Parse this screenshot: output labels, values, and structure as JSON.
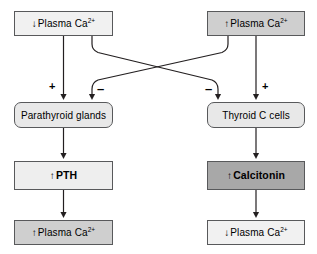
{
  "diagram": {
    "type": "flowchart",
    "colors": {
      "stroke": "#58595b",
      "line": "#231f20",
      "fill_light": "#f1f1f1",
      "fill_pale": "#e8e8e8",
      "fill_mid": "#cfcfcf",
      "fill_dark": "#a8a8a8",
      "text": "#000000",
      "background": "#ffffff"
    },
    "nodes": [
      {
        "id": "low-plasma-ca",
        "arrow": "↓",
        "text": "Plasma Ca",
        "sup": "2+",
        "shape": "rect",
        "fill": "#f1f1f1"
      },
      {
        "id": "high-plasma-ca",
        "arrow": "↑",
        "text": "Plasma Ca",
        "sup": "2+",
        "shape": "rect",
        "fill": "#cfcfcf"
      },
      {
        "id": "parathyroid-glands",
        "arrow": "",
        "text": "Parathyroid glands",
        "sup": "",
        "shape": "rounded",
        "fill": "#e8e8e8"
      },
      {
        "id": "thyroid-c-cells",
        "arrow": "",
        "text": "Thyroid C cells",
        "sup": "",
        "shape": "rounded",
        "fill": "#e8e8e8"
      },
      {
        "id": "pth",
        "arrow": "↑",
        "text": "PTH",
        "sup": "",
        "shape": "rect",
        "fill": "#eeeeee"
      },
      {
        "id": "calcitonin",
        "arrow": "↑",
        "text": "Calcitonin",
        "sup": "",
        "shape": "rect",
        "fill": "#a8a8a8"
      },
      {
        "id": "result-high-plasma-ca",
        "arrow": "↑",
        "text": "Plasma Ca",
        "sup": "2+",
        "shape": "rect",
        "fill": "#cfcfcf"
      },
      {
        "id": "result-low-plasma-ca",
        "arrow": "↓",
        "text": "Plasma Ca",
        "sup": "2+",
        "shape": "rect",
        "fill": "#f1f1f1"
      }
    ],
    "signs": [
      {
        "id": "plus-left",
        "symbol": "+"
      },
      {
        "id": "minus-left",
        "symbol": "–"
      },
      {
        "id": "minus-right",
        "symbol": "–"
      },
      {
        "id": "plus-right",
        "symbol": "+"
      }
    ]
  }
}
